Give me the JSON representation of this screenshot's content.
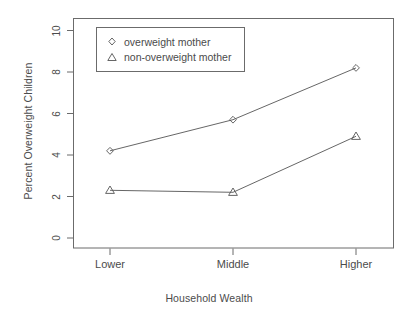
{
  "chart_data": {
    "type": "line",
    "title": "",
    "xlabel": "Household Wealth",
    "ylabel": "Percent Overweight Children",
    "categories": [
      "Lower",
      "Middle",
      "Higher"
    ],
    "series": [
      {
        "name": "overweight mother",
        "marker": "diamond",
        "values": [
          4.2,
          5.7,
          8.2
        ]
      },
      {
        "name": "non-overweight mother",
        "marker": "triangle",
        "values": [
          2.3,
          2.2,
          4.9
        ]
      }
    ],
    "ylim": [
      0,
      10.4
    ],
    "yticks": [
      0,
      2,
      4,
      6,
      8,
      10
    ],
    "ytick_labels": [
      "0",
      "2",
      "4",
      "6",
      "8",
      "10"
    ],
    "xtick_labels": [
      "Lower",
      "Middle",
      "Higher"
    ],
    "grid": false,
    "legend_position": "top-left-inside",
    "line_color": "#555555",
    "axis_color": "#6b6b6b",
    "text_color": "#4b4b4b",
    "background": "#ffffff"
  },
  "legend": {
    "entries": [
      {
        "label": "overweight mother",
        "marker_icon": "diamond-marker-icon"
      },
      {
        "label": "non-overweight mother",
        "marker_icon": "triangle-marker-icon"
      }
    ]
  },
  "axes": {
    "y_title": "Percent Overweight Children",
    "x_title": "Household Wealth",
    "y_ticks": [
      "0",
      "2",
      "4",
      "6",
      "8",
      "10"
    ],
    "x_ticks": [
      "Lower",
      "Middle",
      "Higher"
    ]
  }
}
